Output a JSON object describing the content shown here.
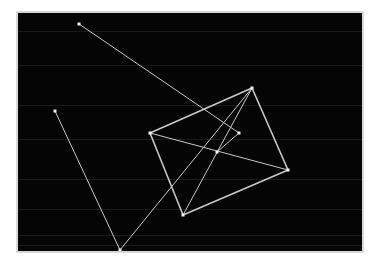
{
  "app": {
    "title": "Wireframe Canvas",
    "background_color": "#ffffff",
    "frame_color": "#d8d8d8",
    "canvas_color": "#050505",
    "stroke_color": "#c8c8c8",
    "node_color": "#f0f0f0",
    "faint_color": "#1a1a1a"
  },
  "canvas": {
    "x": 18,
    "y": 13,
    "width": 344,
    "height": 238,
    "label": "drawing-canvas"
  },
  "chart_data": {
    "type": "scatter",
    "title": "",
    "xlabel": "",
    "ylabel": "",
    "xlim": [
      0,
      344
    ],
    "ylim": [
      0,
      238
    ],
    "grid": false,
    "legend": null,
    "nodes": [
      {
        "id": "n1",
        "name": "quad-left-vertex",
        "x": 132,
        "y": 120
      },
      {
        "id": "n2",
        "name": "quad-top-vertex",
        "x": 234,
        "y": 75
      },
      {
        "id": "n3",
        "name": "quad-right-vertex",
        "x": 270,
        "y": 157
      },
      {
        "id": "n4",
        "name": "quad-bottom-vertex",
        "x": 165,
        "y": 202
      },
      {
        "id": "n5",
        "name": "center-junction-node",
        "x": 199,
        "y": 139
      },
      {
        "id": "n6",
        "name": "upper-small-node",
        "x": 221,
        "y": 120
      },
      {
        "id": "n7",
        "name": "far-upper-left-node",
        "x": 61,
        "y": 11
      },
      {
        "id": "n8",
        "name": "mid-left-node",
        "x": 37,
        "y": 98
      },
      {
        "id": "n9",
        "name": "lower-left-node",
        "x": 102,
        "y": 237
      }
    ],
    "edges": [
      {
        "name": "quad-edge-top-left",
        "from": "n1",
        "to": "n2",
        "weight": 1.6
      },
      {
        "name": "quad-edge-top-right",
        "from": "n2",
        "to": "n3",
        "weight": 1.6
      },
      {
        "name": "quad-edge-bottom-right",
        "from": "n3",
        "to": "n4",
        "weight": 1.6
      },
      {
        "name": "quad-edge-bottom-left",
        "from": "n4",
        "to": "n1",
        "weight": 1.6
      },
      {
        "name": "quad-diagonal-a",
        "from": "n1",
        "to": "n3",
        "weight": 1.0
      },
      {
        "name": "quad-diagonal-b",
        "from": "n2",
        "to": "n4",
        "weight": 1.0
      },
      {
        "name": "long-ray-upper-left",
        "from": "n7",
        "to": "n6",
        "weight": 1.0
      },
      {
        "name": "polyline-left-segment",
        "from": "n8",
        "to": "n9",
        "weight": 1.0
      },
      {
        "name": "polyline-rise-segment",
        "from": "n9",
        "to": "n2",
        "weight": 1.0
      },
      {
        "name": "center-spur",
        "from": "n5",
        "to": "n6",
        "weight": 1.0
      }
    ],
    "node_marker": {
      "shape": "square",
      "size": 3
    },
    "faint_scanlines_y": [
      18,
      52,
      92,
      126,
      166,
      196,
      222,
      232
    ]
  }
}
